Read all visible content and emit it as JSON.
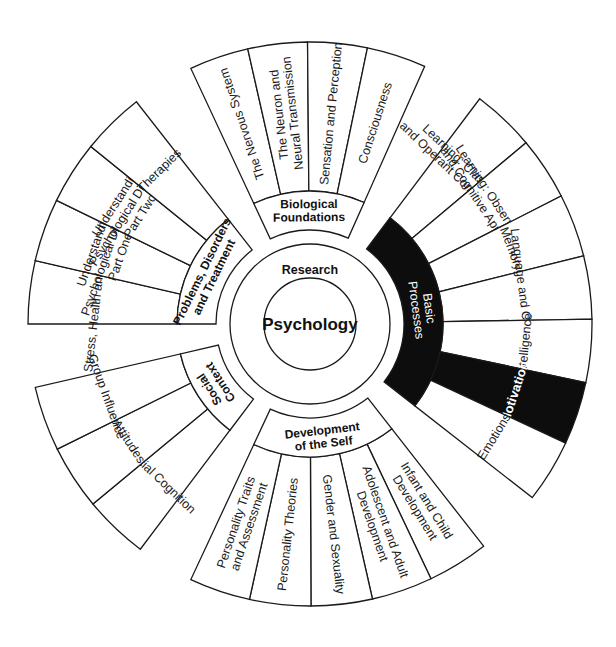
{
  "diagram": {
    "center": {
      "label": "Psychology",
      "ring_label": "Research"
    },
    "colors": {
      "line": "#1a1a1a",
      "fill": "#ffffff",
      "highlight": "#0d0d0d",
      "highlight_text": "#ffffff"
    },
    "categories": [
      {
        "id": "biological-foundations",
        "label": [
          "Biological",
          "Foundations"
        ],
        "start_deg": -25,
        "end_deg": 24,
        "highlight": false,
        "topics": [
          {
            "label": [
              "The Nervous System"
            ]
          },
          {
            "label": [
              "The Neuron and",
              "Neural Transmission"
            ]
          },
          {
            "label": [
              "Sensation and Perception"
            ]
          },
          {
            "label": [
              "Consciousness"
            ]
          }
        ]
      },
      {
        "id": "basic-processes",
        "label": [
          "Basic",
          "Processes"
        ],
        "start_deg": 37,
        "end_deg": 128,
        "highlight": true,
        "topics": [
          {
            "label": [
              "Learning: Classical",
              "and Operant Conditioning"
            ]
          },
          {
            "label": [
              "Learning: Observational",
              "and Cognitive Approaches"
            ]
          },
          {
            "label": [
              "Memory"
            ]
          },
          {
            "label": [
              "Language and Cognition"
            ]
          },
          {
            "label": [
              "Intelligence"
            ]
          },
          {
            "label": [
              "Motivation"
            ],
            "highlight": true
          },
          {
            "label": [
              "Emotions"
            ]
          }
        ]
      },
      {
        "id": "development-of-the-self",
        "label": [
          "Development",
          "of the Self"
        ],
        "start_deg": 142,
        "end_deg": 205,
        "highlight": false,
        "topics": [
          {
            "label": [
              "Infant and Child",
              "Development"
            ]
          },
          {
            "label": [
              "Adolescent and Adult",
              "Development"
            ]
          },
          {
            "label": [
              "Gender and Sexuality"
            ]
          },
          {
            "label": [
              "Personality Theories"
            ]
          },
          {
            "label": [
              "Personality Traits",
              "and Assessment"
            ]
          }
        ]
      },
      {
        "id": "social-context",
        "label": [
          "Social",
          "Context"
        ],
        "start_deg": 217,
        "end_deg": 257,
        "highlight": false,
        "topics": [
          {
            "label": [
              "Social Cognition"
            ]
          },
          {
            "label": [
              "Attitudes"
            ]
          },
          {
            "label": [
              "Group Influence"
            ]
          }
        ]
      },
      {
        "id": "problems-disorders-treatment",
        "label": [
          "Problems, Disorders",
          "and Treatment"
        ],
        "start_deg": 270,
        "end_deg": 322,
        "highlight": false,
        "topics": [
          {
            "label": [
              "Stress, Health and Coping"
            ]
          },
          {
            "label": [
              "Understanding",
              "Psychological Disorders",
              "Part One"
            ]
          },
          {
            "label": [
              "Understanding",
              "Psychological Disorders",
              "Part Two"
            ]
          },
          {
            "label": [
              "Therapies"
            ]
          }
        ]
      }
    ]
  }
}
